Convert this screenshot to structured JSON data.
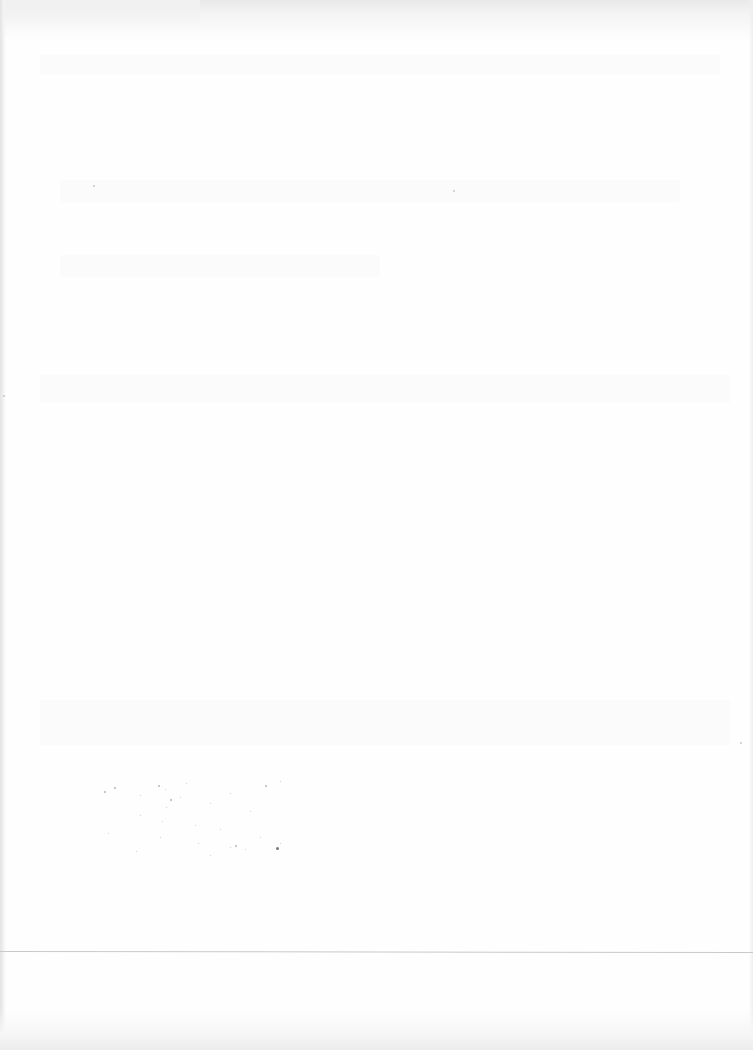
{
  "document": {
    "type": "scanned-page",
    "state": "blank",
    "legible_text": [],
    "features": {
      "horizontal_rule": {
        "y": 951,
        "color": "#c9c9c9"
      },
      "speckle_region": {
        "x": 100,
        "y": 785,
        "width": 215,
        "height": 95
      },
      "paper_color": "#fefefe",
      "edge_shade_color": "#e3e3e3"
    }
  }
}
